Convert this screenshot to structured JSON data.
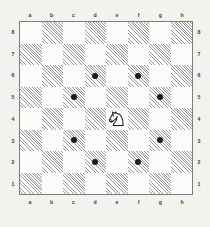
{
  "diagram": {
    "type": "chess-board-diagram"
  },
  "colors": {
    "background": "#f2f2ef",
    "light_square": "#fbfbf9",
    "dark_square_hatch": "#9a9a9a",
    "board_border": "#7d7d7d",
    "dot": "#1b1b1b",
    "piece_outline": "#1b1b1b",
    "piece_fill": "#ffffff",
    "label": "#3a3a3a"
  },
  "board": {
    "files": [
      "a",
      "b",
      "c",
      "d",
      "e",
      "f",
      "g",
      "h"
    ],
    "ranks": [
      "8",
      "7",
      "6",
      "5",
      "4",
      "3",
      "2",
      "1"
    ],
    "size": 8,
    "orientation": "white",
    "light_square_color_name": "white",
    "dark_square_color_name": "hatched gray"
  },
  "pieces": [
    {
      "square": "e4",
      "piece": "knight",
      "color": "white",
      "glyph": "knight-icon"
    }
  ],
  "markers": {
    "style": "dot",
    "squares": [
      "c5",
      "d6",
      "f6",
      "g5",
      "g3",
      "f2",
      "d2",
      "c3"
    ]
  },
  "labels": {
    "files_top": [
      "a",
      "b",
      "c",
      "d",
      "e",
      "f",
      "g",
      "h"
    ],
    "files_bottom": [
      "a",
      "b",
      "c",
      "d",
      "e",
      "f",
      "g",
      "h"
    ],
    "ranks_left": [
      "8",
      "7",
      "6",
      "5",
      "4",
      "3",
      "2",
      "1"
    ],
    "ranks_right": [
      "8",
      "7",
      "6",
      "5",
      "4",
      "3",
      "2",
      "1"
    ]
  }
}
